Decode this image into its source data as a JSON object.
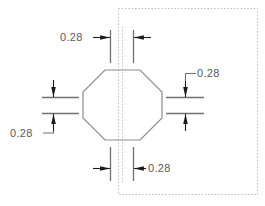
{
  "drawing": {
    "title": "octagon-dimension-drawing",
    "shape_name": "octagon",
    "colors": {
      "line": "#6f7174",
      "shape_outline": "#8b8d90",
      "arrow": "#1a1a1a",
      "text": "#58595b",
      "boundary": "#b9babc",
      "background": "#ffffff"
    },
    "boundary": {
      "name": "dotted-boundary-rectangle",
      "style": "dotted",
      "x": 118,
      "y": 8,
      "width": 140,
      "height": 187
    },
    "shape": {
      "name": "octagon-outline",
      "points": "105,70 140,70 162,92 162,118 140,140 105,140 83,118 83,92",
      "center_x": 122,
      "center_y": 105
    },
    "dimensions": [
      {
        "id": "top",
        "label": "0.28",
        "position": "top",
        "text_x": 60,
        "text_y": 40
      },
      {
        "id": "right",
        "label": "0.28",
        "position": "right",
        "text_x": 197,
        "text_y": 77
      },
      {
        "id": "left",
        "label": "0.28",
        "position": "left",
        "text_x": 10,
        "text_y": 133
      },
      {
        "id": "bottom",
        "label": "0.28",
        "position": "bottom",
        "text_x": 148,
        "text_y": 172
      }
    ]
  }
}
